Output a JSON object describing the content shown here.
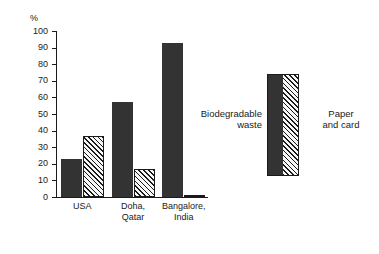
{
  "chart_data": {
    "type": "bar",
    "title": "",
    "xlabel": "",
    "ylabel": "%",
    "ylim": [
      0,
      100
    ],
    "yticks": [
      0,
      10,
      20,
      30,
      40,
      50,
      60,
      70,
      80,
      90,
      100
    ],
    "ytick_labels": [
      "0",
      "10",
      "20",
      "30",
      "40",
      "50",
      "60",
      "70",
      "80",
      "90",
      "100"
    ],
    "grid": false,
    "legend_position": "right",
    "categories": [
      "USA",
      "Doha,\nQatar",
      "Bangalore,\nIndia"
    ],
    "category_labels": [
      {
        "line1": "USA",
        "line2": ""
      },
      {
        "line1": "Doha,",
        "line2": "Qatar"
      },
      {
        "line1": "Bangalore,",
        "line2": "India"
      }
    ],
    "series": [
      {
        "name": "Biodegradable waste",
        "fill": "solid",
        "color": "#333333",
        "values": [
          23,
          57,
          93
        ]
      },
      {
        "name": "Paper and card",
        "fill": "hatched",
        "color": "#f2f2f2",
        "values": [
          37,
          17,
          1
        ]
      }
    ],
    "legend": [
      {
        "label_line1": "Biodegradable",
        "label_line2": "waste",
        "fill": "solid"
      },
      {
        "label_line1": "Paper",
        "label_line2": "and card",
        "fill": "hatched"
      }
    ]
  }
}
